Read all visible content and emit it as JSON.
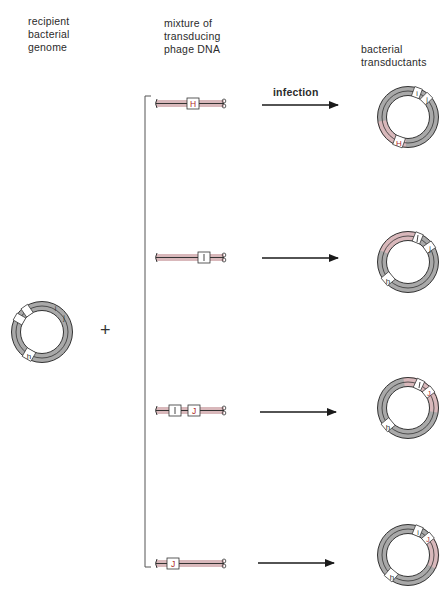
{
  "headings": {
    "recipient": [
      "recipient",
      "bacterial",
      "genome"
    ],
    "mixture": [
      "mixture of",
      "transducing",
      "phage DNA"
    ],
    "transductants": [
      "bacterial",
      "transductants"
    ]
  },
  "arrow_label": "infection",
  "operator": "+",
  "colors": {
    "genome_gray": "#a9a9a9",
    "donor_pink": "#d9b8bb",
    "outline": "#333333",
    "marker_red": "#b02a2a"
  },
  "recipient_genome": {
    "markers": [
      "h",
      "i",
      "j"
    ]
  },
  "phage_dnas": [
    {
      "markers": [
        "H"
      ]
    },
    {
      "markers": [
        "I"
      ]
    },
    {
      "markers": [
        "I",
        "J"
      ]
    },
    {
      "markers": [
        "J"
      ]
    }
  ],
  "transductants": [
    {
      "markers": [
        "H",
        "i",
        "j"
      ],
      "donor_marker": "H"
    },
    {
      "markers": [
        "h",
        "I",
        "j"
      ],
      "donor_marker": "I"
    },
    {
      "markers": [
        "h",
        "I",
        "J"
      ],
      "donor_marker": "I,J"
    },
    {
      "markers": [
        "h",
        "i",
        "J"
      ],
      "donor_marker": "J"
    }
  ]
}
